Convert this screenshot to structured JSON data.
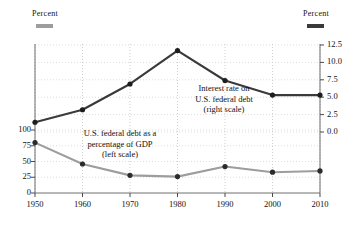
{
  "header": {
    "left_axis_title": "Percent",
    "right_axis_title": "Percent",
    "left_swatch_color": "#9d9d9d",
    "right_swatch_color": "#3a3a3a"
  },
  "annotations": {
    "interest_rate": {
      "line1": "Interest rate on",
      "line2": "U.S. federal debt",
      "line3": "(right scale)"
    },
    "debt_gdp": {
      "line1": "U.S. federal debt as a",
      "line2": "percentage of GDP",
      "line3": "(left scale)"
    }
  },
  "axes": {
    "x_ticks": [
      "1950",
      "1960",
      "1970",
      "1980",
      "1990",
      "2000",
      "2010"
    ],
    "left_ticks": [
      "100",
      "75",
      "50",
      "25",
      "0"
    ],
    "right_ticks": [
      "12.5",
      "10.0",
      "7.5",
      "5.0",
      "2.5",
      "0.0"
    ]
  },
  "chart_data": {
    "type": "line",
    "title": "",
    "subtitle": "",
    "xlabel": "",
    "ylabel": "Percent",
    "y2label": "Percent",
    "x": [
      1950,
      1960,
      1970,
      1980,
      1990,
      2000,
      2010
    ],
    "grid": true,
    "legend_position": "inline-annotations",
    "ylim": [
      0,
      125
    ],
    "y2lim": [
      0,
      12.5
    ],
    "xlim": [
      1950,
      2010
    ],
    "series": [
      {
        "name": "U.S. federal debt as a percentage of GDP (left scale)",
        "axis": "left",
        "color": "#9d9d9d",
        "values": [
          80,
          46,
          28,
          26,
          42,
          33,
          35
        ]
      },
      {
        "name": "Interest rate on U.S. federal debt (right scale)",
        "axis": "right",
        "color": "#3a3a3a",
        "values": [
          1.4,
          3.2,
          6.9,
          11.7,
          7.4,
          5.3,
          5.3
        ]
      }
    ]
  }
}
